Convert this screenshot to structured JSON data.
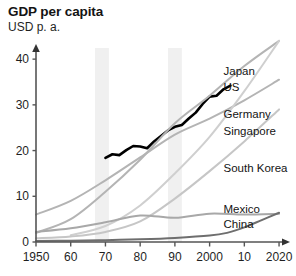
{
  "header": {
    "title": "GDP per capita",
    "subtitle": "USD p. a."
  },
  "chart_data": {
    "type": "line",
    "title": "GDP per capita",
    "subtitle": "USD p. a.",
    "xlabel": "",
    "ylabel": "USD p. a.",
    "xlim": [
      1950,
      2022
    ],
    "ylim": [
      0,
      42
    ],
    "yticks": [
      0,
      10,
      20,
      30,
      40
    ],
    "ytick_labels": [
      "0",
      "10",
      "20",
      "30",
      "40"
    ],
    "xticks": [
      1950,
      1960,
      1970,
      1980,
      1990,
      2000,
      2010,
      2020
    ],
    "xtick_labels": [
      "1950",
      "60",
      "70",
      "80",
      "90",
      "2000",
      "10",
      "2020"
    ],
    "grid": false,
    "legend_position": "inline-right",
    "units": "thousand USD per annum",
    "shaded_bands": [
      {
        "label": "band-1",
        "x0": 1967,
        "x1": 1971,
        "color": "#f0f0f0"
      },
      {
        "label": "band-2",
        "x0": 1988,
        "x1": 1992,
        "color": "#f0f0f0"
      }
    ],
    "series": [
      {
        "name": "US",
        "color": "#000000",
        "width": 2.6,
        "label_x": 2004,
        "label_y": 33.0,
        "x": [
          1970,
          1972,
          1974,
          1976,
          1978,
          1980,
          1982,
          1984,
          1986,
          1988,
          1990,
          1992,
          1994,
          1996,
          1998,
          2000,
          2002,
          2004,
          2006
        ],
        "values": [
          18.4,
          19.2,
          19.0,
          20.1,
          21.0,
          20.9,
          20.5,
          22.0,
          23.2,
          24.4,
          25.2,
          25.6,
          27.0,
          28.3,
          30.2,
          31.8,
          32.0,
          33.4,
          34.2
        ]
      },
      {
        "name": "Japan",
        "color": "#b4b4b4",
        "width": 2.0,
        "label_x": 2004,
        "label_y": 36.6,
        "x": [
          1950,
          1960,
          1970,
          1980,
          1990,
          2000,
          2010,
          2020
        ],
        "values": [
          2.0,
          5.0,
          11.0,
          18.0,
          26.0,
          32.0,
          38.5,
          44.0
        ]
      },
      {
        "name": "Germany",
        "color": "#b4b4b4",
        "width": 2.0,
        "label_x": 2004,
        "label_y": 27.2,
        "x": [
          1950,
          1960,
          1970,
          1980,
          1990,
          2000,
          2010,
          2020
        ],
        "values": [
          6.0,
          9.0,
          13.5,
          18.5,
          23.5,
          27.0,
          31.0,
          35.5
        ]
      },
      {
        "name": "Singapore",
        "color": "#cfcfcf",
        "width": 2.0,
        "label_x": 2004,
        "label_y": 23.4,
        "x": [
          1960,
          1970,
          1980,
          1990,
          2000,
          2010,
          2020
        ],
        "values": [
          1.5,
          3.5,
          8.0,
          15.0,
          23.0,
          33.0,
          44.0
        ]
      },
      {
        "name": "South Korea",
        "color": "#c6c6c6",
        "width": 2.0,
        "label_x": 2004,
        "label_y": 15.4,
        "x": [
          1950,
          1960,
          1970,
          1980,
          1990,
          2000,
          2010,
          2020
        ],
        "values": [
          0.8,
          1.2,
          2.2,
          4.5,
          9.5,
          15.5,
          22.0,
          29.0
        ]
      },
      {
        "name": "Mexico",
        "color": "#a8a8a8",
        "width": 2.0,
        "label_x": 2004,
        "label_y": 6.4,
        "x": [
          1950,
          1960,
          1970,
          1980,
          1990,
          2000,
          2010,
          2020
        ],
        "values": [
          2.2,
          3.0,
          4.3,
          5.8,
          5.3,
          6.2,
          6.0,
          6.2
        ]
      },
      {
        "name": "China",
        "color": "#6e6e6e",
        "width": 2.0,
        "label_x": 2004,
        "label_y": 3.0,
        "x": [
          1950,
          1960,
          1970,
          1980,
          1990,
          2000,
          2005,
          2010,
          2015,
          2020
        ],
        "values": [
          0.2,
          0.3,
          0.4,
          0.6,
          0.9,
          1.4,
          2.0,
          3.2,
          4.8,
          6.4
        ]
      }
    ]
  },
  "axis": {
    "arrow_x": "x-axis-arrow",
    "arrow_y": "y-axis-arrow"
  }
}
